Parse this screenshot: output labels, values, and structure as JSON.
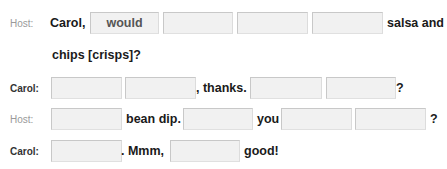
{
  "rows": [
    {
      "speaker": "Host:",
      "parts": {
        "t0": "Carol,",
        "b0": "would",
        "b1": "",
        "b2": "",
        "b3": "",
        "t1": "salsa and"
      }
    },
    {
      "speaker": "",
      "parts": {
        "t0": "chips [crisps]?"
      }
    },
    {
      "speaker": "Carol:",
      "parts": {
        "b0": "",
        "b1": "",
        "t0": ", thanks.",
        "b2": "",
        "b3": "",
        "t1": "?"
      }
    },
    {
      "speaker": "Host:",
      "parts": {
        "b0": "",
        "t0": "bean dip.",
        "b1": "",
        "t1": "you",
        "b2": "",
        "b3": "",
        "t2": "?"
      }
    },
    {
      "speaker": "Carol:",
      "parts": {
        "b0": "",
        "t0": ". Mmm,",
        "b1": "",
        "t1": "good!"
      }
    }
  ]
}
